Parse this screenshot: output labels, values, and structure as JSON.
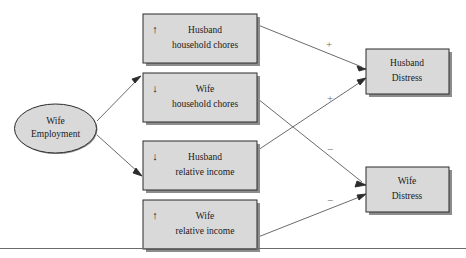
{
  "diagram": {
    "colors": {
      "box_fill": "#d9d9d9",
      "box_stroke": "#2b2b2b",
      "shadow": "#8d8d8d",
      "edge": "#5a5a5a",
      "sign": "#6e6e6e"
    },
    "source_node": {
      "id": "wife-employment",
      "shape": "ellipse",
      "line1": "Wife",
      "line2": "Employment"
    },
    "mediators": [
      {
        "id": "husband-household-chores",
        "arrow": "up",
        "arrow_glyph": "↑",
        "line1": "Husband",
        "line2": "household chores"
      },
      {
        "id": "wife-household-chores",
        "arrow": "down",
        "arrow_glyph": "↓",
        "line1": "Wife",
        "line2": "household chores"
      },
      {
        "id": "husband-relative-income",
        "arrow": "down",
        "arrow_glyph": "↓",
        "line1": "Husband",
        "line2": "relative income"
      },
      {
        "id": "wife-relative-income",
        "arrow": "up",
        "arrow_glyph": "↑",
        "line1": "Wife",
        "line2": "relative income"
      }
    ],
    "outcomes": [
      {
        "id": "husband-distress",
        "line1": "Husband",
        "line2": "Distress"
      },
      {
        "id": "wife-distress",
        "line1": "Wife",
        "line2": "Distress"
      }
    ],
    "edge_signs": [
      {
        "id": "sign-husband-chores-to-husband-distress",
        "label": "+",
        "from": "husband-household-chores",
        "to": "husband-distress"
      },
      {
        "id": "sign-husband-income-to-husband-distress",
        "label": "+",
        "from": "husband-relative-income",
        "to": "husband-distress"
      },
      {
        "id": "sign-wife-chores-to-wife-distress",
        "label": "−",
        "from": "wife-household-chores",
        "to": "wife-distress"
      },
      {
        "id": "sign-wife-income-to-wife-distress",
        "label": "−",
        "from": "wife-relative-income",
        "to": "wife-distress"
      }
    ]
  }
}
